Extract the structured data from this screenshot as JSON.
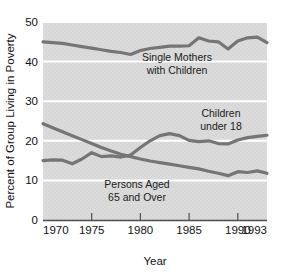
{
  "chart_data": {
    "type": "line",
    "title": "",
    "xlabel": "Year",
    "ylabel": "Percent of Group Living in Poverty",
    "xlim": [
      1970,
      1993
    ],
    "ylim": [
      0,
      50
    ],
    "xticks": [
      1970,
      1975,
      1980,
      1985,
      1990,
      1993
    ],
    "xtick_labels": [
      "1970",
      "1975",
      "1980",
      "1985",
      "1990",
      "1993"
    ],
    "yticks": [
      0,
      10,
      20,
      30,
      40,
      50
    ],
    "ytick_labels": [
      "0",
      "10",
      "20",
      "30",
      "40",
      "50"
    ],
    "grid": "horizontal",
    "legend_position": "inline-annotations",
    "plot_background": "#d9d9d9",
    "line_color": "#757575",
    "x": [
      1970,
      1971,
      1972,
      1973,
      1974,
      1975,
      1976,
      1977,
      1978,
      1979,
      1980,
      1981,
      1982,
      1983,
      1984,
      1985,
      1986,
      1987,
      1988,
      1989,
      1990,
      1991,
      1992,
      1993
    ],
    "series": [
      {
        "name": "Single Mothers with Children",
        "label_line1": "Single Mothers",
        "label_line2": "with Children",
        "values": [
          45.0,
          44.8,
          44.6,
          44.2,
          43.8,
          43.4,
          43.0,
          42.6,
          42.3,
          41.8,
          42.8,
          43.3,
          43.6,
          43.9,
          43.9,
          44.0,
          46.0,
          45.2,
          45.0,
          43.2,
          45.2,
          46.0,
          46.2,
          44.8
        ]
      },
      {
        "name": "Children under 18",
        "label_line1": "Children",
        "label_line2": "under 18",
        "values": [
          15.0,
          15.2,
          15.1,
          14.2,
          15.4,
          17.0,
          16.0,
          16.2,
          15.9,
          16.4,
          18.3,
          20.0,
          21.3,
          21.8,
          21.3,
          20.1,
          19.8,
          20.0,
          19.3,
          19.2,
          20.2,
          20.8,
          21.1,
          21.4
        ]
      },
      {
        "name": "Persons Aged 65 and Over",
        "label_line1": "Persons Aged",
        "label_line2": "65 and Over",
        "values": [
          24.3,
          23.3,
          22.3,
          21.3,
          20.3,
          19.3,
          18.3,
          17.4,
          16.6,
          16.0,
          15.4,
          14.9,
          14.5,
          14.1,
          13.7,
          13.3,
          12.9,
          12.3,
          11.8,
          11.2,
          12.2,
          12.0,
          12.4,
          11.8
        ]
      }
    ]
  }
}
